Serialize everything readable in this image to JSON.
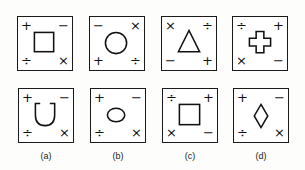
{
  "problem_figures": [
    {
      "shape": "square",
      "corners": {
        "tl": "+",
        "tr": "−",
        "bl": "÷",
        "br": "×"
      }
    },
    {
      "shape": "circle",
      "corners": {
        "tl": "−",
        "tr": "×",
        "bl": "+",
        "br": "÷"
      }
    },
    {
      "shape": "triangle",
      "corners": {
        "tl": "×",
        "tr": "÷",
        "bl": "−",
        "br": "+"
      }
    },
    {
      "shape": "cross",
      "corners": {
        "tl": "÷",
        "tr": "+",
        "bl": "×",
        "br": "−"
      }
    }
  ],
  "answer_figures": [
    {
      "label": "(a)",
      "shape": "u-shape",
      "corners": {
        "tl": "+",
        "tr": "−",
        "bl": "÷",
        "br": "×"
      }
    },
    {
      "label": "(b)",
      "shape": "ellipse",
      "corners": {
        "tl": "+",
        "tr": "−",
        "bl": "÷",
        "br": "×"
      }
    },
    {
      "label": "(c)",
      "shape": "square",
      "corners": {
        "tl": "÷",
        "tr": "+",
        "bl": "×",
        "br": "−"
      }
    },
    {
      "label": "(d)",
      "shape": "diamond",
      "corners": {
        "tl": "+",
        "tr": "−",
        "bl": "÷",
        "br": "×"
      }
    }
  ]
}
